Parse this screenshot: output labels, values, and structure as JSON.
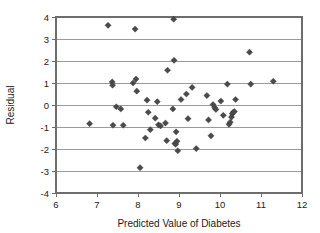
{
  "chart_data": {
    "type": "scatter",
    "title": "",
    "xlabel": "Predicted Value of Diabetes",
    "ylabel": "Residual",
    "xlim": [
      6,
      12
    ],
    "ylim": [
      -4,
      4
    ],
    "xticks": [
      6,
      7,
      8,
      9,
      10,
      11,
      12
    ],
    "yticks": [
      -4,
      -3,
      -2,
      -1,
      0,
      1,
      2,
      3,
      4
    ],
    "xtick_labels": [
      "6",
      "7",
      "8",
      "9",
      "10",
      "11",
      "12"
    ],
    "ytick_labels": [
      "-4",
      "-3",
      "-2",
      "-1",
      "0",
      "1",
      "2",
      "3",
      "4"
    ],
    "grid": "horizontal",
    "legend": "none",
    "marker": "diamond",
    "marker_color": "#4a4a4a",
    "series": [
      {
        "name": "Residuals",
        "points": [
          [
            6.82,
            -0.85
          ],
          [
            7.27,
            3.62
          ],
          [
            7.37,
            1.05
          ],
          [
            7.38,
            0.9
          ],
          [
            7.39,
            -0.92
          ],
          [
            7.47,
            -0.08
          ],
          [
            7.58,
            -0.18
          ],
          [
            7.64,
            -0.92
          ],
          [
            7.88,
            1.0
          ],
          [
            7.93,
            3.45
          ],
          [
            7.95,
            1.18
          ],
          [
            7.97,
            0.63
          ],
          [
            8.05,
            -2.85
          ],
          [
            8.18,
            -1.5
          ],
          [
            8.22,
            0.22
          ],
          [
            8.25,
            -0.33
          ],
          [
            8.3,
            -1.12
          ],
          [
            8.42,
            -0.6
          ],
          [
            8.47,
            0.15
          ],
          [
            8.5,
            -0.9
          ],
          [
            8.55,
            -0.95
          ],
          [
            8.67,
            -0.82
          ],
          [
            8.7,
            -1.62
          ],
          [
            8.72,
            1.58
          ],
          [
            8.85,
            -0.18
          ],
          [
            8.87,
            3.9
          ],
          [
            8.88,
            2.03
          ],
          [
            8.9,
            -1.75
          ],
          [
            8.92,
            -1.78
          ],
          [
            8.93,
            -1.22
          ],
          [
            8.95,
            -1.65
          ],
          [
            8.97,
            -2.08
          ],
          [
            9.05,
            0.25
          ],
          [
            9.18,
            0.5
          ],
          [
            9.22,
            -0.62
          ],
          [
            9.32,
            0.8
          ],
          [
            9.42,
            -1.98
          ],
          [
            9.68,
            0.43
          ],
          [
            9.72,
            -0.68
          ],
          [
            9.78,
            -1.4
          ],
          [
            9.83,
            0.02
          ],
          [
            9.87,
            -0.12
          ],
          [
            9.9,
            -0.2
          ],
          [
            10.02,
            0.18
          ],
          [
            10.08,
            -0.47
          ],
          [
            10.18,
            0.95
          ],
          [
            10.22,
            -0.88
          ],
          [
            10.25,
            -0.78
          ],
          [
            10.28,
            -0.55
          ],
          [
            10.3,
            -0.4
          ],
          [
            10.32,
            -0.33
          ],
          [
            10.35,
            -0.3
          ],
          [
            10.38,
            0.25
          ],
          [
            10.72,
            2.4
          ],
          [
            10.75,
            0.95
          ],
          [
            11.3,
            1.08
          ]
        ]
      }
    ]
  },
  "axes": {
    "x_title": "Predicted Value of Diabetes",
    "y_title": "Residual"
  }
}
